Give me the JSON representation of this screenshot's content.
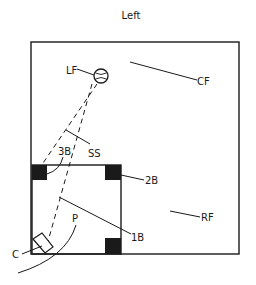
{
  "title": "Left",
  "colors": {
    "ink": "#1a1a1a",
    "background": "#ffffff"
  },
  "positions": {
    "lf": "LF",
    "cf": "CF",
    "ss": "SS",
    "third_base": "3B",
    "second_base": "2B",
    "first_base": "1B",
    "rf": "RF",
    "pitcher": "P",
    "catcher": "C"
  },
  "elements": {
    "ball": "baseball-icon",
    "bases": [
      "third-base",
      "second-base",
      "first-base"
    ],
    "dashed_paths": [
      "ball-to-third-path",
      "ball-to-home-path"
    ]
  }
}
